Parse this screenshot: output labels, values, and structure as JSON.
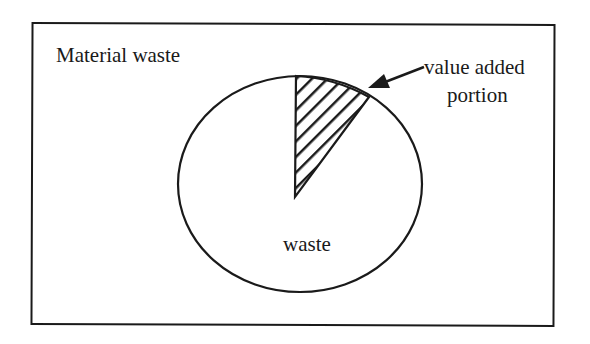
{
  "diagram": {
    "title": "Material waste",
    "whole_label": "waste",
    "slice_label_line1": "value added",
    "slice_label_line2": "portion",
    "colors": {
      "stroke": "#1a1a1a",
      "background": "#ffffff"
    }
  }
}
